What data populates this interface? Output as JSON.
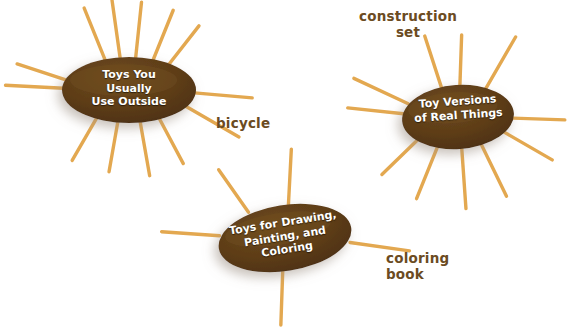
{
  "diagram": {
    "background_color": "#ffffff",
    "oval_fill_color": "#5a3a16",
    "oval_highlight_color": "#7a5524",
    "ray_color": "#e3a850",
    "oval_text_color": "#ffffff",
    "label_text_color": "#6b4b22"
  },
  "clusters": [
    {
      "id": "toys-you-usually-use-outside",
      "oval_text": "Toys You\nUsually\nUse Outside",
      "cx": 129,
      "cy": 90,
      "rx": 67,
      "ry": 33,
      "text_rotation": 0,
      "rays": [
        {
          "angle": 248,
          "inner": 0.92,
          "length": 58
        },
        {
          "angle": 262,
          "inner": 0.92,
          "length": 60
        },
        {
          "angle": 276,
          "inner": 0.92,
          "length": 58
        },
        {
          "angle": 292,
          "inner": 0.94,
          "length": 55
        },
        {
          "angle": 308,
          "inner": 0.95,
          "length": 50
        },
        {
          "angle": 183,
          "inner": 0.98,
          "length": 58
        },
        {
          "angle": 198,
          "inner": 0.98,
          "length": 52
        },
        {
          "angle": 5,
          "inner": 0.98,
          "length": 58
        },
        {
          "angle": 30,
          "inner": 0.97,
          "length": 62
        },
        {
          "angle": 62,
          "inner": 0.95,
          "length": 52
        },
        {
          "angle": 80,
          "inner": 0.94,
          "length": 56
        },
        {
          "angle": 100,
          "inner": 0.94,
          "length": 52
        },
        {
          "angle": 120,
          "inner": 0.95,
          "length": 50
        }
      ],
      "label": {
        "text": "bicycle",
        "x": 216,
        "y": 116,
        "align": "left"
      }
    },
    {
      "id": "toy-versions-of-real-things",
      "oval_text": "Toy Versions\nof Real Things",
      "cx": 458,
      "cy": 117,
      "rx": 56,
      "ry": 32,
      "text_rotation": -4,
      "rays": [
        {
          "angle": 252,
          "inner": 0.94,
          "length": 55
        },
        {
          "angle": 272,
          "inner": 0.94,
          "length": 52
        },
        {
          "angle": 300,
          "inner": 0.95,
          "length": 62
        },
        {
          "angle": 186,
          "inner": 0.98,
          "length": 56
        },
        {
          "angle": 205,
          "inner": 0.98,
          "length": 60
        },
        {
          "angle": 2,
          "inner": 0.98,
          "length": 52
        },
        {
          "angle": 30,
          "inner": 0.96,
          "length": 55
        },
        {
          "angle": 64,
          "inner": 0.94,
          "length": 58
        },
        {
          "angle": 86,
          "inner": 0.93,
          "length": 62
        },
        {
          "angle": 112,
          "inner": 0.94,
          "length": 58
        },
        {
          "angle": 136,
          "inner": 0.96,
          "length": 52
        }
      ],
      "label": {
        "text": "construction\nset",
        "x": 359,
        "y": 9,
        "align": "center"
      }
    },
    {
      "id": "toys-for-drawing-painting-and-coloring",
      "oval_text": "Toys for Drawing,\nPainting, and\nColoring",
      "cx": 285,
      "cy": 238,
      "rx": 67,
      "ry": 33,
      "text_rotation": -9,
      "rays": [
        {
          "angle": 235,
          "inner": 0.95,
          "length": 52
        },
        {
          "angle": 273,
          "inner": 0.94,
          "length": 58
        },
        {
          "angle": 184,
          "inner": 0.98,
          "length": 58
        },
        {
          "angle": 8,
          "inner": 0.98,
          "length": 60
        },
        {
          "angle": 92,
          "inner": 0.94,
          "length": 56
        }
      ],
      "label": {
        "text": "coloring\nbook",
        "x": 386,
        "y": 251,
        "align": "left"
      }
    }
  ]
}
